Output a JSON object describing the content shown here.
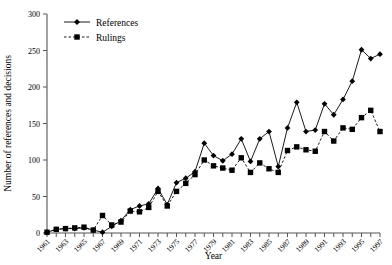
{
  "chart_data": {
    "type": "line",
    "title": "",
    "xlabel": "Year",
    "ylabel": "Number of references and decisions",
    "xlim": [
      1961,
      1997
    ],
    "ylim": [
      0,
      300
    ],
    "yticks": [
      0,
      50,
      100,
      150,
      200,
      250,
      300
    ],
    "ytick_labels": [
      "0",
      "50",
      "100",
      "150",
      "200",
      "250",
      "300"
    ],
    "x": [
      1961,
      1962,
      1963,
      1964,
      1965,
      1966,
      1967,
      1968,
      1969,
      1970,
      1971,
      1972,
      1973,
      1974,
      1975,
      1976,
      1977,
      1978,
      1979,
      1980,
      1981,
      1982,
      1983,
      1984,
      1985,
      1986,
      1987,
      1988,
      1989,
      1990,
      1991,
      1992,
      1993,
      1994,
      1995,
      1996,
      1997
    ],
    "xtick_labels": [
      "1961",
      "1963",
      "1965",
      "1967",
      "1969",
      "1971",
      "1973",
      "1975",
      "1977",
      "1979",
      "1981",
      "1983",
      "1985",
      "1987",
      "1989",
      "1991",
      "1993",
      "1995",
      "1997"
    ],
    "xtick_label_years": [
      1961,
      1963,
      1965,
      1967,
      1969,
      1971,
      1973,
      1975,
      1977,
      1979,
      1981,
      1983,
      1985,
      1987,
      1989,
      1991,
      1993,
      1995,
      1997
    ],
    "grid": false,
    "legend_position": "top-left-inside",
    "series": [
      {
        "name": "References",
        "marker": "diamond",
        "line_style": "solid",
        "color": "#000000",
        "values": [
          1,
          5,
          6,
          6,
          7,
          4,
          1,
          9,
          17,
          32,
          37,
          40,
          61,
          39,
          69,
          75,
          84,
          123,
          106,
          99,
          108,
          129,
          98,
          129,
          139,
          91,
          144,
          179,
          139,
          141,
          177,
          162,
          183,
          208,
          251,
          239,
          245
        ]
      },
      {
        "name": "Rulings",
        "marker": "square",
        "line_style": "dashed",
        "color": "#000000",
        "values": [
          1,
          5,
          6,
          7,
          8,
          4,
          24,
          11,
          15,
          30,
          29,
          35,
          57,
          37,
          57,
          68,
          80,
          100,
          92,
          89,
          86,
          103,
          83,
          96,
          88,
          83,
          113,
          118,
          114,
          112,
          139,
          126,
          144,
          142,
          158,
          168,
          139
        ]
      }
    ]
  }
}
